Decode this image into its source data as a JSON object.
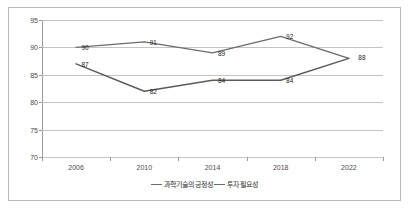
{
  "chart_data": {
    "type": "line",
    "title": "",
    "xlabel": "",
    "ylabel": "",
    "categories": [
      "2006",
      "2010",
      "2014",
      "2018",
      "2022"
    ],
    "ylim": [
      70,
      95
    ],
    "yticks": [
      70,
      75,
      80,
      85,
      90,
      95
    ],
    "grid": true,
    "legend_position": "bottom",
    "series": [
      {
        "name": "과학기술의 긍정성",
        "values": [
          90,
          91,
          89,
          92,
          88
        ],
        "color": "#6b6b6b"
      },
      {
        "name": "투자 필요성",
        "values": [
          87,
          82,
          84,
          84,
          88
        ],
        "color": "#5a5a5a"
      }
    ]
  },
  "legend": {
    "entries": [
      {
        "label": "과학기술의 긍정성"
      },
      {
        "label": "투자 필요성"
      }
    ]
  }
}
